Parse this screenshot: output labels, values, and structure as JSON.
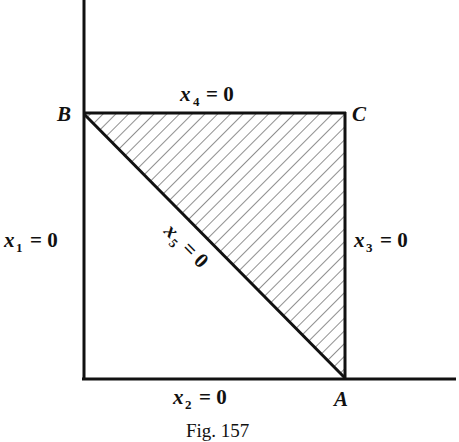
{
  "figure": {
    "caption": "Fig. 157",
    "vertices": {
      "A": "A",
      "B": "B",
      "C": "C"
    },
    "constraints": {
      "x1": {
        "var": "x",
        "sub": "1",
        "eq": "= 0"
      },
      "x2": {
        "var": "x",
        "sub": "2",
        "eq": "= 0"
      },
      "x3": {
        "var": "x",
        "sub": "3",
        "eq": "= 0"
      },
      "x4": {
        "var": "x",
        "sub": "4",
        "eq": "= 0"
      },
      "x5": {
        "var": "x",
        "sub": "5",
        "eq": "= 0"
      }
    },
    "shaded_region": "triangle ABC (hatched)",
    "colors": {
      "line": "#111111",
      "hatch": "#333333",
      "background": "#ffffff"
    }
  }
}
